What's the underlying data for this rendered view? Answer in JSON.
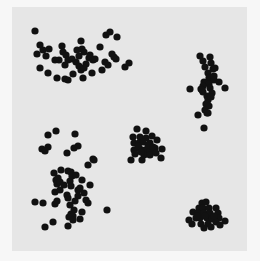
{
  "colors": {
    "page_background": "#f7f7f7",
    "panel_background": "#e6e6e6",
    "point": "#111111"
  },
  "chart_data": {
    "type": "scatter",
    "title": "",
    "xlabel": "",
    "ylabel": "",
    "axes_visible": false,
    "grid": false,
    "legend": null,
    "panel": {
      "x": 12,
      "y": 7,
      "width": 235,
      "height": 244
    },
    "point_radius": 3.6,
    "series": [
      {
        "name": "cluster-top-left",
        "points": [
          [
            35,
            31
          ],
          [
            40,
            45
          ],
          [
            37,
            54
          ],
          [
            43,
            50
          ],
          [
            46,
            56
          ],
          [
            40,
            68
          ],
          [
            48,
            73
          ],
          [
            57,
            78
          ],
          [
            65,
            79
          ],
          [
            68,
            80
          ],
          [
            73,
            74
          ],
          [
            83,
            78
          ],
          [
            92,
            73
          ],
          [
            62,
            46
          ],
          [
            63,
            52
          ],
          [
            66,
            55
          ],
          [
            59,
            60
          ],
          [
            65,
            65
          ],
          [
            68,
            60
          ],
          [
            72,
            59
          ],
          [
            77,
            50
          ],
          [
            81,
            41
          ],
          [
            82,
            49
          ],
          [
            84,
            52
          ],
          [
            76,
            62
          ],
          [
            79,
            56
          ],
          [
            79,
            66
          ],
          [
            81,
            70
          ],
          [
            84,
            68
          ],
          [
            86,
            64
          ],
          [
            89,
            58
          ],
          [
            90,
            55
          ],
          [
            93,
            60
          ],
          [
            95,
            59
          ],
          [
            102,
            70
          ],
          [
            108,
            65
          ],
          [
            106,
            35
          ],
          [
            110,
            32
          ],
          [
            117,
            37
          ],
          [
            112,
            54
          ],
          [
            114,
            57
          ],
          [
            116,
            59
          ],
          [
            125,
            67
          ],
          [
            129,
            63
          ],
          [
            100,
            47
          ],
          [
            105,
            62
          ],
          [
            55,
            60
          ],
          [
            49,
            49
          ]
        ]
      },
      {
        "name": "cluster-top-right",
        "points": [
          [
            200,
            56
          ],
          [
            203,
            61
          ],
          [
            210,
            57
          ],
          [
            211,
            63
          ],
          [
            205,
            67
          ],
          [
            213,
            69
          ],
          [
            215,
            68
          ],
          [
            208,
            73
          ],
          [
            209,
            78
          ],
          [
            204,
            82
          ],
          [
            214,
            80
          ],
          [
            209,
            84
          ],
          [
            203,
            86
          ],
          [
            210,
            88
          ],
          [
            219,
            82
          ],
          [
            201,
            89
          ],
          [
            190,
            89
          ],
          [
            225,
            88
          ],
          [
            203,
            92
          ],
          [
            212,
            93
          ],
          [
            207,
            96
          ],
          [
            208,
            100
          ],
          [
            211,
            97
          ],
          [
            206,
            104
          ],
          [
            209,
            106
          ],
          [
            205,
            110
          ],
          [
            208,
            113
          ],
          [
            198,
            115
          ],
          [
            207,
            113
          ],
          [
            204,
            128
          ],
          [
            202,
            90
          ],
          [
            214,
            76
          ]
        ]
      },
      {
        "name": "cluster-middle",
        "points": [
          [
            137,
            129
          ],
          [
            146,
            131
          ],
          [
            133,
            137
          ],
          [
            140,
            137
          ],
          [
            146,
            138
          ],
          [
            152,
            136
          ],
          [
            134,
            143
          ],
          [
            139,
            143
          ],
          [
            143,
            142
          ],
          [
            150,
            143
          ],
          [
            157,
            140
          ],
          [
            162,
            149
          ],
          [
            134,
            150
          ],
          [
            140,
            149
          ],
          [
            145,
            150
          ],
          [
            150,
            151
          ],
          [
            155,
            148
          ],
          [
            135,
            154
          ],
          [
            144,
            155
          ],
          [
            150,
            155
          ],
          [
            161,
            158
          ],
          [
            142,
            160
          ],
          [
            131,
            160
          ],
          [
            148,
            145
          ],
          [
            153,
            147
          ],
          [
            138,
            146
          ],
          [
            156,
            153
          ],
          [
            141,
            152
          ]
        ]
      },
      {
        "name": "cluster-bottom-left",
        "points": [
          [
            48,
            135
          ],
          [
            56,
            131
          ],
          [
            75,
            134
          ],
          [
            48,
            147
          ],
          [
            42,
            149
          ],
          [
            45,
            151
          ],
          [
            78,
            146
          ],
          [
            74,
            148
          ],
          [
            67,
            153
          ],
          [
            94,
            160
          ],
          [
            88,
            165
          ],
          [
            93,
            159
          ],
          [
            54,
            173
          ],
          [
            61,
            170
          ],
          [
            68,
            171
          ],
          [
            71,
            172
          ],
          [
            56,
            180
          ],
          [
            58,
            178
          ],
          [
            70,
            181
          ],
          [
            72,
            176
          ],
          [
            57,
            184
          ],
          [
            60,
            182
          ],
          [
            76,
            175
          ],
          [
            71,
            186
          ],
          [
            82,
            180
          ],
          [
            90,
            185
          ],
          [
            64,
            185
          ],
          [
            55,
            192
          ],
          [
            67,
            195
          ],
          [
            68,
            198
          ],
          [
            78,
            190
          ],
          [
            80,
            188
          ],
          [
            84,
            193
          ],
          [
            70,
            205
          ],
          [
            78,
            196
          ],
          [
            75,
            201
          ],
          [
            86,
            200
          ],
          [
            88,
            203
          ],
          [
            35,
            202
          ],
          [
            43,
            203
          ],
          [
            55,
            204
          ],
          [
            57,
            201
          ],
          [
            107,
            210
          ],
          [
            74,
            210
          ],
          [
            71,
            214
          ],
          [
            73,
            216
          ],
          [
            69,
            217
          ],
          [
            73,
            220
          ],
          [
            80,
            219
          ],
          [
            82,
            212
          ],
          [
            53,
            222
          ],
          [
            45,
            227
          ],
          [
            68,
            226
          ],
          [
            60,
            190
          ]
        ]
      },
      {
        "name": "cluster-bottom-right",
        "points": [
          [
            202,
            203
          ],
          [
            206,
            202
          ],
          [
            199,
            208
          ],
          [
            203,
            208
          ],
          [
            209,
            208
          ],
          [
            216,
            208
          ],
          [
            193,
            212
          ],
          [
            198,
            213
          ],
          [
            204,
            213
          ],
          [
            210,
            213
          ],
          [
            218,
            213
          ],
          [
            196,
            218
          ],
          [
            200,
            218
          ],
          [
            207,
            218
          ],
          [
            212,
            219
          ],
          [
            219,
            218
          ],
          [
            225,
            221
          ],
          [
            189,
            220
          ],
          [
            192,
            224
          ],
          [
            201,
            224
          ],
          [
            208,
            224
          ],
          [
            216,
            222
          ],
          [
            204,
            228
          ],
          [
            211,
            227
          ],
          [
            220,
            225
          ],
          [
            197,
            216
          ],
          [
            214,
            216
          ],
          [
            205,
            216
          ]
        ]
      }
    ]
  }
}
